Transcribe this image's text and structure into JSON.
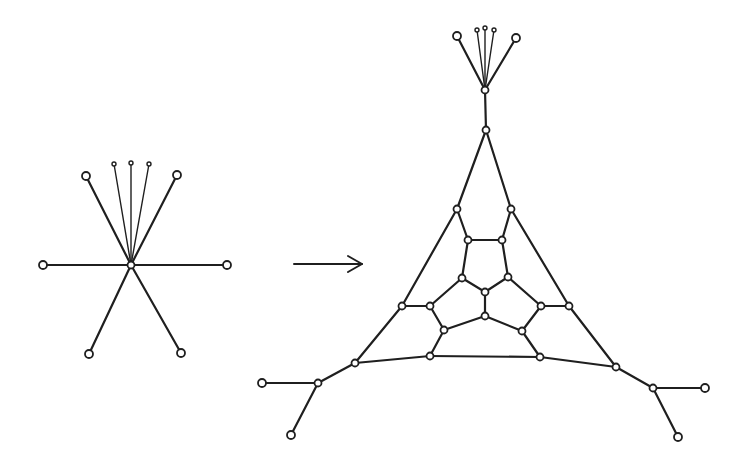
{
  "figure": {
    "colors": {
      "stroke": "#1f1f1f",
      "background": "#ffffff"
    }
  },
  "left_graph": {
    "nodes": [
      {
        "id": "c",
        "x": 131,
        "y": 265,
        "r": 3.5
      },
      {
        "id": "ul",
        "x": 86,
        "y": 176,
        "r": 4
      },
      {
        "id": "ur",
        "x": 177,
        "y": 175,
        "r": 4
      },
      {
        "id": "l",
        "x": 43,
        "y": 265,
        "r": 4
      },
      {
        "id": "r",
        "x": 227,
        "y": 265,
        "r": 4
      },
      {
        "id": "dl",
        "x": 89,
        "y": 354,
        "r": 4
      },
      {
        "id": "dr",
        "x": 181,
        "y": 353,
        "r": 4
      },
      {
        "id": "t1",
        "x": 114,
        "y": 164,
        "r": 2,
        "small": true
      },
      {
        "id": "t2",
        "x": 131,
        "y": 163,
        "r": 2,
        "small": true
      },
      {
        "id": "t3",
        "x": 149,
        "y": 164,
        "r": 2,
        "small": true
      }
    ],
    "edges": [
      [
        "c",
        "ul"
      ],
      [
        "c",
        "ur"
      ],
      [
        "c",
        "l"
      ],
      [
        "c",
        "r"
      ],
      [
        "c",
        "dl"
      ],
      [
        "c",
        "dr"
      ],
      [
        "c",
        "t1",
        "thin"
      ],
      [
        "c",
        "t2",
        "thin"
      ],
      [
        "c",
        "t3",
        "thin"
      ]
    ]
  },
  "arrow": {
    "x1": 294,
    "y1": 264,
    "x2": 362,
    "y2": 264,
    "label": "→"
  },
  "right_graph": {
    "nodes": [
      {
        "id": "fan",
        "x": 485,
        "y": 90,
        "r": 3.5
      },
      {
        "id": "fl",
        "x": 457,
        "y": 36,
        "r": 4
      },
      {
        "id": "fr",
        "x": 516,
        "y": 38,
        "r": 4
      },
      {
        "id": "f1",
        "x": 477,
        "y": 30,
        "r": 2,
        "small": true
      },
      {
        "id": "f2",
        "x": 485,
        "y": 28,
        "r": 2,
        "small": true
      },
      {
        "id": "f3",
        "x": 494,
        "y": 30,
        "r": 2,
        "small": true
      },
      {
        "id": "top",
        "x": 486,
        "y": 130,
        "r": 3.5
      },
      {
        "id": "a1",
        "x": 457,
        "y": 209,
        "r": 3.5
      },
      {
        "id": "a2",
        "x": 511,
        "y": 209,
        "r": 3.5
      },
      {
        "id": "b1",
        "x": 468,
        "y": 240,
        "r": 3.5
      },
      {
        "id": "b2",
        "x": 502,
        "y": 240,
        "r": 3.5
      },
      {
        "id": "c1",
        "x": 462,
        "y": 278,
        "r": 3.5
      },
      {
        "id": "c2",
        "x": 508,
        "y": 277,
        "r": 3.5
      },
      {
        "id": "ctr",
        "x": 485,
        "y": 292,
        "r": 3.5
      },
      {
        "id": "d1",
        "x": 402,
        "y": 306,
        "r": 3.5
      },
      {
        "id": "d2",
        "x": 430,
        "y": 306,
        "r": 3.5
      },
      {
        "id": "d3",
        "x": 541,
        "y": 306,
        "r": 3.5
      },
      {
        "id": "d4",
        "x": 569,
        "y": 306,
        "r": 3.5
      },
      {
        "id": "ctr2",
        "x": 485,
        "y": 316,
        "r": 3.5
      },
      {
        "id": "e1",
        "x": 444,
        "y": 330,
        "r": 3.5
      },
      {
        "id": "e2",
        "x": 522,
        "y": 331,
        "r": 3.5
      },
      {
        "id": "g1",
        "x": 430,
        "y": 356,
        "r": 3.5
      },
      {
        "id": "g2",
        "x": 540,
        "y": 357,
        "r": 3.5
      },
      {
        "id": "h1",
        "x": 355,
        "y": 363,
        "r": 3.5
      },
      {
        "id": "h2",
        "x": 616,
        "y": 367,
        "r": 3.5
      },
      {
        "id": "i1",
        "x": 318,
        "y": 383,
        "r": 3.5
      },
      {
        "id": "i2",
        "x": 653,
        "y": 388,
        "r": 3.5
      },
      {
        "id": "j1",
        "x": 262,
        "y": 383,
        "r": 4
      },
      {
        "id": "j2",
        "x": 705,
        "y": 388,
        "r": 4
      },
      {
        "id": "k1",
        "x": 291,
        "y": 435,
        "r": 4
      },
      {
        "id": "k2",
        "x": 678,
        "y": 437,
        "r": 4
      }
    ],
    "edges": [
      [
        "fan",
        "fl"
      ],
      [
        "fan",
        "fr"
      ],
      [
        "fan",
        "f1",
        "thin"
      ],
      [
        "fan",
        "f2",
        "thin"
      ],
      [
        "fan",
        "f3",
        "thin"
      ],
      [
        "fan",
        "top"
      ],
      [
        "top",
        "a1"
      ],
      [
        "top",
        "a2"
      ],
      [
        "a1",
        "b1"
      ],
      [
        "a2",
        "b2"
      ],
      [
        "b1",
        "b2"
      ],
      [
        "b1",
        "c1"
      ],
      [
        "b2",
        "c2"
      ],
      [
        "c1",
        "ctr"
      ],
      [
        "c2",
        "ctr"
      ],
      [
        "ctr",
        "ctr2"
      ],
      [
        "a1",
        "d1"
      ],
      [
        "a2",
        "d4"
      ],
      [
        "d1",
        "d2"
      ],
      [
        "d3",
        "d4"
      ],
      [
        "c1",
        "d2"
      ],
      [
        "c2",
        "d3"
      ],
      [
        "d2",
        "e1"
      ],
      [
        "d3",
        "e2"
      ],
      [
        "e1",
        "ctr2"
      ],
      [
        "e2",
        "ctr2"
      ],
      [
        "e1",
        "g1"
      ],
      [
        "e2",
        "g2"
      ],
      [
        "d1",
        "h1"
      ],
      [
        "d4",
        "h2"
      ],
      [
        "h1",
        "g1"
      ],
      [
        "g1",
        "g2"
      ],
      [
        "g2",
        "h2"
      ],
      [
        "h1",
        "i1"
      ],
      [
        "h2",
        "i2"
      ],
      [
        "i1",
        "j1"
      ],
      [
        "i1",
        "k1"
      ],
      [
        "i2",
        "j2"
      ],
      [
        "i2",
        "k2"
      ]
    ]
  }
}
